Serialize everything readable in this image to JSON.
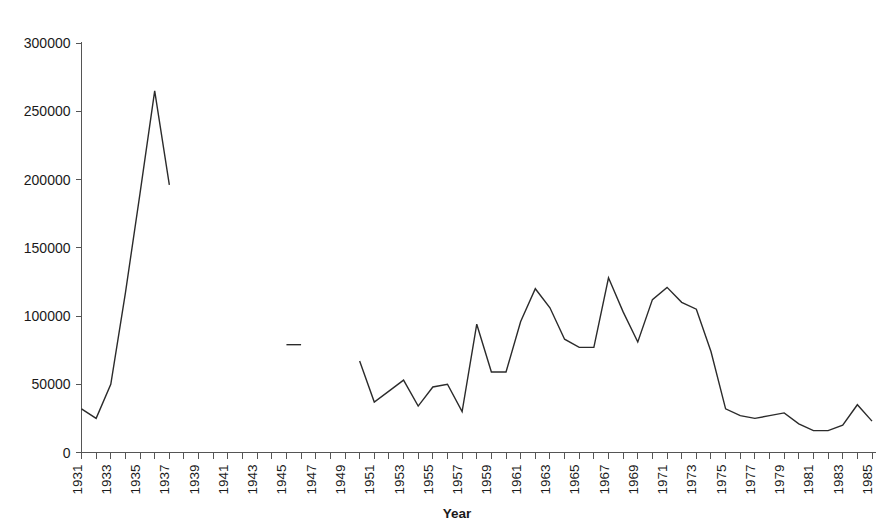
{
  "chart_data": {
    "type": "line",
    "title": "",
    "xlabel": "Year",
    "ylabel": "",
    "xlim": [
      1931,
      1985
    ],
    "ylim": [
      0,
      300000
    ],
    "grid": false,
    "legend": "none",
    "y_ticks": [
      0,
      50000,
      100000,
      150000,
      200000,
      250000,
      300000
    ],
    "y_tick_labels": [
      "0",
      "50000",
      "100000",
      "150000",
      "200000",
      "250000",
      "300000"
    ],
    "x_ticks_all_years": true,
    "x_tick_labels": [
      "1931",
      "1933",
      "1935",
      "1937",
      "1939",
      "1941",
      "1943",
      "1945",
      "1947",
      "1949",
      "1951",
      "1953",
      "1955",
      "1957",
      "1959",
      "1961",
      "1963",
      "1965",
      "1967",
      "1969",
      "1971",
      "1973",
      "1975",
      "1977",
      "1979",
      "1981",
      "1983",
      "1985"
    ],
    "x_tick_label_years": [
      1931,
      1933,
      1935,
      1937,
      1939,
      1941,
      1943,
      1945,
      1947,
      1949,
      1951,
      1953,
      1955,
      1957,
      1959,
      1961,
      1963,
      1965,
      1967,
      1969,
      1971,
      1973,
      1975,
      1977,
      1979,
      1981,
      1983,
      1985
    ],
    "line_color": "#2b2b2b",
    "segments": [
      {
        "name": "segment-1931-1937",
        "x": [
          1931,
          1932,
          1933,
          1934,
          1935,
          1936,
          1937
        ],
        "y": [
          32000,
          25000,
          50000,
          117000,
          190000,
          265000,
          196000
        ]
      },
      {
        "name": "segment-1945-1946",
        "x": [
          1945,
          1946
        ],
        "y": [
          79000,
          79000
        ]
      },
      {
        "name": "segment-1950-1985",
        "x": [
          1950,
          1951,
          1952,
          1953,
          1954,
          1955,
          1956,
          1957,
          1958,
          1959,
          1960,
          1961,
          1962,
          1963,
          1964,
          1965,
          1966,
          1967,
          1968,
          1969,
          1970,
          1971,
          1972,
          1973,
          1974,
          1975,
          1976,
          1977,
          1978,
          1979,
          1980,
          1981,
          1982,
          1983,
          1984,
          1985
        ],
        "y": [
          67000,
          37000,
          45000,
          53000,
          34000,
          48000,
          50000,
          30000,
          94000,
          59000,
          59000,
          96000,
          120000,
          106000,
          83000,
          77000,
          77000,
          128000,
          103000,
          81000,
          112000,
          121000,
          110000,
          105000,
          74000,
          32000,
          27000,
          25000,
          27000,
          29000,
          21000,
          16000,
          16000,
          20000,
          35000,
          23000
        ]
      }
    ]
  },
  "axes": {
    "x_axis_title": "Year"
  }
}
